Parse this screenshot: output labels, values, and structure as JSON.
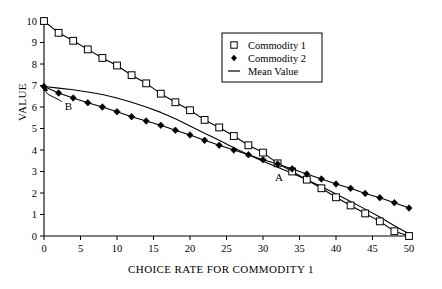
{
  "chart_data": {
    "type": "line",
    "title": "",
    "xlabel": "CHOICE RATE FOR COMMODITY 1",
    "ylabel": "VALUE",
    "xlim": [
      0,
      50
    ],
    "ylim": [
      0,
      10
    ],
    "xticks": [
      0,
      5,
      10,
      15,
      20,
      25,
      30,
      35,
      40,
      45,
      50
    ],
    "yticks": [
      0,
      1,
      2,
      3,
      4,
      5,
      6,
      7,
      8,
      9,
      10
    ],
    "grid": false,
    "legend_position": "upper-right",
    "legend_entries": [
      {
        "label": "Commodity 1",
        "marker": "open-square"
      },
      {
        "label": "Commodity 2",
        "marker": "filled-diamond"
      },
      {
        "label": "Mean Value",
        "marker": "line"
      }
    ],
    "annotations": [
      {
        "text": "A",
        "x": 32.2,
        "y": 2.55
      },
      {
        "text": "B",
        "x": 2.3,
        "y": 6.05
      }
    ],
    "series": [
      {
        "name": "Commodity 1",
        "marker": "open-square",
        "x": [
          0,
          2,
          4,
          6,
          8,
          10,
          12,
          14,
          16,
          18,
          20,
          22,
          24,
          26,
          28,
          30,
          32,
          34,
          36,
          38,
          40,
          42,
          44,
          46,
          48,
          50
        ],
        "values": [
          10.0,
          9.45,
          9.08,
          8.68,
          8.28,
          7.93,
          7.48,
          7.1,
          6.62,
          6.22,
          5.85,
          5.4,
          5.05,
          4.65,
          4.22,
          3.88,
          3.38,
          3.0,
          2.62,
          2.22,
          1.8,
          1.42,
          1.05,
          0.68,
          0.22,
          0.0
        ]
      },
      {
        "name": "Commodity 2",
        "marker": "filled-diamond",
        "x": [
          0,
          2,
          4,
          6,
          8,
          10,
          12,
          14,
          16,
          18,
          20,
          22,
          24,
          26,
          28,
          30,
          32,
          34,
          36,
          38,
          40,
          42,
          44,
          46,
          48,
          50
        ],
        "values": [
          6.95,
          6.65,
          6.42,
          6.2,
          6.0,
          5.78,
          5.55,
          5.35,
          5.15,
          4.92,
          4.7,
          4.45,
          4.22,
          4.0,
          3.78,
          3.55,
          3.35,
          3.12,
          2.88,
          2.65,
          2.42,
          2.22,
          1.98,
          1.78,
          1.55,
          1.3
        ]
      },
      {
        "name": "Mean Value",
        "marker": "line",
        "x": [
          0,
          2,
          4,
          6,
          8,
          10,
          12,
          14,
          16,
          18,
          20,
          22,
          24,
          26,
          28,
          30,
          32,
          34,
          36,
          38,
          40,
          42,
          44,
          46,
          48,
          50
        ],
        "values": [
          6.95,
          6.88,
          6.8,
          6.7,
          6.58,
          6.42,
          6.22,
          6.0,
          5.75,
          5.45,
          5.12,
          4.78,
          4.45,
          4.1,
          3.78,
          3.48,
          3.2,
          2.92,
          2.62,
          2.3,
          1.95,
          1.6,
          1.25,
          0.88,
          0.48,
          0.1
        ]
      }
    ]
  }
}
